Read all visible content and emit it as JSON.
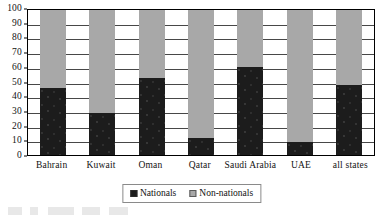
{
  "chart_data": {
    "type": "bar",
    "subtype": "stacked-percentage-column",
    "title": "",
    "subtitle": "",
    "xlabel": "",
    "ylabel": "",
    "ylim": [
      0,
      100
    ],
    "ytick_step": 10,
    "ytick_labels": [
      "100",
      "90",
      "80",
      "70",
      "60",
      "50",
      "40",
      "30",
      "20",
      "10",
      "0"
    ],
    "ytick_values": [
      100,
      90,
      80,
      70,
      60,
      50,
      40,
      30,
      20,
      10,
      0
    ],
    "grid": "horizontal",
    "legend_position": "bottom-center",
    "categories": [
      "Bahrain",
      "Kuwait",
      "Oman",
      "Qatar",
      "Saudi Arabia",
      "UAE",
      "all states"
    ],
    "series": [
      {
        "name": "Nationals",
        "color": "#1c1c1c",
        "values": [
          46,
          29,
          53,
          12,
          61,
          9,
          48
        ]
      },
      {
        "name": "Non-nationals",
        "color": "#a8a8a8",
        "values": [
          54,
          71,
          47,
          88,
          39,
          91,
          52
        ]
      }
    ]
  },
  "legend": {
    "entries": [
      {
        "label": "Nationals",
        "swatch": "black-square-icon"
      },
      {
        "label": "Non-nationals",
        "swatch": "gray-square-icon"
      }
    ]
  }
}
